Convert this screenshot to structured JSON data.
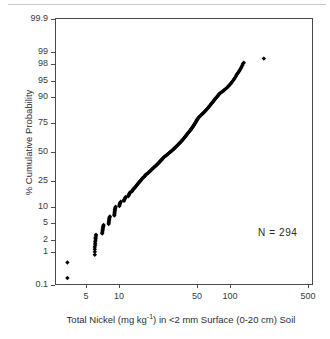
{
  "chart_data": {
    "type": "scatter",
    "title": "",
    "subtitle": "",
    "xlabel_text": "Total Nickel (mg kg",
    "xlabel_sup": "-1",
    "xlabel_tail": ") in <2 mm Surface (0-20 cm) Soil",
    "xlabel": "Total Nickel (mg kg-1) in <2 mm Surface (0-20 cm) Soil",
    "ylabel": "% Cumulative Probability",
    "xscale": "log",
    "yscale": "probit",
    "xlim": [
      3.0,
      620
    ],
    "ylim": [
      0.07,
      99.95
    ],
    "grid": false,
    "legend": false,
    "annotations": [
      {
        "name": "sample-size",
        "text": "N =  294",
        "x": 150,
        "y": 2.2
      }
    ],
    "xticks": [
      {
        "value": 5,
        "label": "5"
      },
      {
        "value": 10,
        "label": "10"
      },
      {
        "value": 50,
        "label": "50"
      },
      {
        "value": 100,
        "label": "100"
      },
      {
        "value": 500,
        "label": "500"
      }
    ],
    "yticks": [
      {
        "value": 99.9,
        "label": "99.9"
      },
      {
        "value": 99,
        "label": "99"
      },
      {
        "value": 98,
        "label": "98"
      },
      {
        "value": 95,
        "label": "95"
      },
      {
        "value": 90,
        "label": "90"
      },
      {
        "value": 75,
        "label": "75"
      },
      {
        "value": 50,
        "label": "50"
      },
      {
        "value": 25,
        "label": "25"
      },
      {
        "value": 10,
        "label": "10"
      },
      {
        "value": 5,
        "label": "5"
      },
      {
        "value": 2,
        "label": "2"
      },
      {
        "value": 1,
        "label": "1"
      },
      {
        "value": 0.1,
        "label": "0.1"
      }
    ],
    "marker": {
      "shape": "diamond",
      "color": "#000000",
      "size_px": 4
    },
    "n": 294,
    "series": [
      {
        "name": "Total Nickel cumulative probability",
        "color": "#000000",
        "points": [
          [
            3.4,
            0.17
          ],
          [
            3.4,
            0.51
          ],
          [
            6.0,
            0.85
          ],
          [
            6.0,
            1.02
          ],
          [
            6.0,
            1.19
          ],
          [
            6.0,
            1.36
          ],
          [
            6.05,
            1.53
          ],
          [
            6.05,
            1.7
          ],
          [
            6.05,
            1.87
          ],
          [
            6.1,
            2.04
          ],
          [
            6.1,
            2.21
          ],
          [
            6.1,
            2.38
          ],
          [
            6.15,
            2.55
          ],
          [
            6.15,
            2.72
          ],
          [
            7.0,
            2.9
          ],
          [
            7.0,
            3.1
          ],
          [
            7.05,
            3.3
          ],
          [
            7.05,
            3.5
          ],
          [
            7.1,
            3.7
          ],
          [
            7.1,
            3.9
          ],
          [
            7.15,
            4.1
          ],
          [
            7.15,
            4.3
          ],
          [
            7.2,
            4.5
          ],
          [
            8.0,
            4.7
          ],
          [
            8.0,
            4.95
          ],
          [
            8.05,
            5.2
          ],
          [
            8.05,
            5.5
          ],
          [
            8.1,
            5.8
          ],
          [
            8.1,
            6.1
          ],
          [
            8.15,
            6.4
          ],
          [
            8.2,
            6.7
          ],
          [
            9.0,
            7.0
          ],
          [
            9.0,
            7.4
          ],
          [
            9.05,
            7.8
          ],
          [
            9.05,
            8.2
          ],
          [
            9.1,
            8.6
          ],
          [
            9.1,
            9.0
          ],
          [
            9.15,
            9.4
          ],
          [
            9.2,
            9.8
          ],
          [
            9.25,
            10.2
          ],
          [
            10.0,
            10.5
          ],
          [
            10.0,
            10.9
          ],
          [
            10.1,
            11.3
          ],
          [
            10.1,
            11.7
          ],
          [
            10.2,
            12.0
          ],
          [
            10.3,
            12.4
          ],
          [
            11.0,
            12.8
          ],
          [
            11.0,
            13.2
          ],
          [
            11.1,
            13.6
          ],
          [
            11.2,
            14.0
          ],
          [
            11.3,
            14.4
          ],
          [
            11.4,
            14.8
          ],
          [
            12.0,
            15.2
          ],
          [
            12.1,
            15.7
          ],
          [
            12.2,
            16.1
          ],
          [
            12.3,
            16.6
          ],
          [
            12.4,
            17.0
          ],
          [
            12.5,
            17.5
          ],
          [
            13.0,
            18.0
          ],
          [
            13.1,
            18.5
          ],
          [
            13.2,
            19.0
          ],
          [
            13.4,
            19.5
          ],
          [
            13.6,
            20.0
          ],
          [
            13.8,
            20.5
          ],
          [
            14.0,
            21.0
          ],
          [
            14.2,
            21.6
          ],
          [
            14.4,
            22.2
          ],
          [
            14.6,
            22.8
          ],
          [
            14.8,
            23.4
          ],
          [
            15.0,
            24.0
          ],
          [
            15.2,
            24.5
          ],
          [
            15.4,
            25.0
          ],
          [
            15.6,
            25.6
          ],
          [
            15.8,
            26.2
          ],
          [
            16.0,
            26.8
          ],
          [
            16.3,
            27.4
          ],
          [
            16.6,
            28.0
          ],
          [
            16.9,
            28.6
          ],
          [
            17.0,
            29.2
          ],
          [
            17.3,
            29.8
          ],
          [
            17.6,
            30.4
          ],
          [
            18.0,
            31.0
          ],
          [
            18.3,
            31.7
          ],
          [
            18.6,
            32.4
          ],
          [
            19.0,
            33.0
          ],
          [
            19.3,
            33.7
          ],
          [
            19.6,
            34.4
          ],
          [
            20.0,
            35.0
          ],
          [
            20.3,
            35.7
          ],
          [
            20.6,
            36.4
          ],
          [
            21.0,
            37.0
          ],
          [
            21.4,
            37.7
          ],
          [
            21.8,
            38.4
          ],
          [
            22.0,
            39.0
          ],
          [
            22.4,
            39.7
          ],
          [
            22.8,
            40.4
          ],
          [
            23.0,
            41.0
          ],
          [
            23.4,
            41.7
          ],
          [
            23.8,
            42.4
          ],
          [
            24.0,
            43.0
          ],
          [
            24.4,
            43.7
          ],
          [
            24.8,
            44.4
          ],
          [
            25.0,
            45.0
          ],
          [
            25.5,
            45.7
          ],
          [
            26.0,
            46.4
          ],
          [
            26.5,
            47.0
          ],
          [
            27.0,
            47.7
          ],
          [
            27.5,
            48.4
          ],
          [
            28.0,
            49.0
          ],
          [
            28.5,
            49.7
          ],
          [
            29.0,
            50.3
          ],
          [
            29.5,
            51.0
          ],
          [
            30.0,
            51.7
          ],
          [
            30.5,
            52.4
          ],
          [
            31.0,
            53.0
          ],
          [
            31.5,
            53.7
          ],
          [
            32.0,
            54.4
          ],
          [
            32.5,
            55.0
          ],
          [
            33.0,
            55.7
          ],
          [
            33.5,
            56.4
          ],
          [
            34.0,
            57.0
          ],
          [
            34.5,
            57.7
          ],
          [
            35.0,
            58.4
          ],
          [
            35.5,
            59.0
          ],
          [
            36.0,
            59.7
          ],
          [
            36.5,
            60.4
          ],
          [
            37.0,
            61.0
          ],
          [
            37.5,
            61.7
          ],
          [
            38.0,
            62.4
          ],
          [
            38.5,
            63.0
          ],
          [
            39.0,
            63.7
          ],
          [
            39.5,
            64.4
          ],
          [
            40.0,
            65.0
          ],
          [
            40.5,
            65.7
          ],
          [
            41.0,
            66.4
          ],
          [
            41.5,
            67.0
          ],
          [
            42.0,
            67.6
          ],
          [
            42.5,
            68.2
          ],
          [
            43.0,
            68.8
          ],
          [
            43.5,
            69.4
          ],
          [
            44.0,
            70.0
          ],
          [
            44.5,
            70.6
          ],
          [
            45.0,
            71.2
          ],
          [
            45.6,
            71.8
          ],
          [
            46.0,
            72.4
          ],
          [
            46.6,
            73.0
          ],
          [
            47.0,
            73.6
          ],
          [
            47.6,
            74.2
          ],
          [
            48.0,
            74.8
          ],
          [
            48.6,
            75.4
          ],
          [
            49.0,
            76.0
          ],
          [
            49.6,
            76.6
          ],
          [
            50.0,
            77.2
          ],
          [
            50.6,
            77.8
          ],
          [
            51.0,
            78.4
          ],
          [
            52.0,
            79.0
          ],
          [
            53.0,
            79.6
          ],
          [
            54.0,
            80.2
          ],
          [
            55.0,
            80.8
          ],
          [
            56.0,
            81.3
          ],
          [
            57.0,
            81.8
          ],
          [
            58.0,
            82.3
          ],
          [
            59.0,
            82.8
          ],
          [
            60.0,
            83.3
          ],
          [
            61.0,
            83.8
          ],
          [
            62.0,
            84.3
          ],
          [
            63.0,
            84.8
          ],
          [
            64.0,
            85.3
          ],
          [
            65.0,
            85.8
          ],
          [
            66.0,
            86.3
          ],
          [
            67.0,
            86.8
          ],
          [
            68.0,
            87.2
          ],
          [
            69.0,
            87.6
          ],
          [
            70.0,
            88.0
          ],
          [
            71.0,
            88.4
          ],
          [
            72.0,
            88.8
          ],
          [
            73.0,
            89.2
          ],
          [
            74.0,
            89.5
          ],
          [
            75.0,
            89.8
          ],
          [
            76.0,
            90.1
          ],
          [
            77.0,
            90.4
          ],
          [
            78.0,
            90.7
          ],
          [
            79.0,
            91.0
          ],
          [
            80.0,
            91.3
          ],
          [
            82.0,
            91.6
          ],
          [
            84.0,
            91.9
          ],
          [
            86.0,
            92.2
          ],
          [
            88.0,
            92.5
          ],
          [
            90.0,
            92.8
          ],
          [
            92.0,
            93.1
          ],
          [
            94.0,
            93.4
          ],
          [
            96.0,
            93.7
          ],
          [
            98.0,
            94.0
          ],
          [
            100.0,
            94.3
          ],
          [
            102.0,
            94.6
          ],
          [
            104.0,
            94.9
          ],
          [
            106.0,
            95.2
          ],
          [
            108.0,
            95.5
          ],
          [
            110.0,
            95.8
          ],
          [
            112.0,
            96.1
          ],
          [
            114.0,
            96.4
          ],
          [
            116.0,
            96.6
          ],
          [
            118.0,
            96.8
          ],
          [
            120.0,
            97.0
          ],
          [
            122.0,
            97.2
          ],
          [
            124.0,
            97.4
          ],
          [
            126.0,
            97.6
          ],
          [
            128.0,
            97.8
          ],
          [
            130.0,
            98.0
          ],
          [
            132.0,
            98.1
          ],
          [
            200.0,
            98.5
          ],
          [
            600.0,
            98.9
          ],
          [
            1200.0,
            99.2
          ],
          [
            2800.0,
            99.5
          ],
          [
            2900.0,
            99.85
          ]
        ]
      }
    ]
  }
}
